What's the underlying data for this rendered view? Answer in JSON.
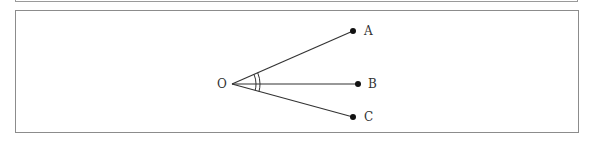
{
  "diagram": {
    "type": "angle-diagram",
    "vertex": {
      "label": "O"
    },
    "points": [
      {
        "id": "A",
        "label": "A"
      },
      {
        "id": "B",
        "label": "B"
      },
      {
        "id": "C",
        "label": "C"
      }
    ],
    "rays": [
      "OA",
      "OB",
      "OC"
    ],
    "angle_marks": [
      {
        "between": [
          "OA",
          "OB"
        ],
        "arcs": 1
      },
      {
        "between": [
          "OB",
          "OC"
        ],
        "arcs": 1
      }
    ],
    "colors": {
      "line": "#333333",
      "border": "#8c8c8c"
    }
  }
}
